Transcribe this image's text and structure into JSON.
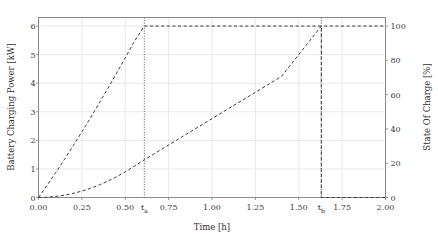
{
  "chart_data": {
    "type": "line",
    "title": "",
    "xlabel": "Time [h]",
    "ylabel": "Battery Charging Power [kW]",
    "ylabel_right": "State Of Charge [%]",
    "xlim": [
      0.0,
      2.0
    ],
    "ylim": [
      0.0,
      6.3
    ],
    "ylim_right": [
      0.0,
      105.0
    ],
    "grid": true,
    "legend": "none",
    "xticks": [
      "0.00",
      "0.25",
      "0.50",
      "0.75",
      "1.00",
      "1.25",
      "1.50",
      "1.75",
      "2.00"
    ],
    "xtick_values": [
      0.0,
      0.25,
      0.5,
      0.75,
      1.0,
      1.25,
      1.5,
      1.75,
      2.0
    ],
    "yticks_left": [
      "0",
      "1",
      "2",
      "3",
      "4",
      "5",
      "6"
    ],
    "ytick_values_left": [
      0,
      1,
      2,
      3,
      4,
      5,
      6
    ],
    "yticks_right": [
      "0",
      "20",
      "40",
      "60",
      "80",
      "100"
    ],
    "ytick_values_right": [
      0,
      20,
      40,
      60,
      80,
      100
    ],
    "annotations": [
      {
        "name": "t_a",
        "label": "t",
        "sub": "a",
        "x": 0.61
      },
      {
        "name": "t_b",
        "label": "t",
        "sub": "b",
        "x": 1.63
      }
    ],
    "series": [
      {
        "name": "Battery Charging Power",
        "axis": "left",
        "style": "dashed",
        "color": "#3c3c3c",
        "x": [
          0.0,
          0.05,
          0.1,
          0.15,
          0.2,
          0.25,
          0.3,
          0.35,
          0.4,
          0.45,
          0.5,
          0.55,
          0.61,
          0.61,
          0.8,
          1.0,
          1.2,
          1.4,
          1.63,
          1.63,
          1.8,
          2.0
        ],
        "y": [
          0.0,
          0.43,
          0.88,
          1.34,
          1.81,
          2.3,
          2.79,
          3.3,
          3.82,
          4.35,
          4.89,
          5.44,
          6.0,
          6.0,
          6.0,
          6.0,
          6.0,
          6.0,
          6.0,
          0.0,
          0.0,
          0.0
        ]
      },
      {
        "name": "State Of Charge",
        "axis": "right",
        "style": "dashed",
        "color": "#3c3c3c",
        "x": [
          0.0,
          0.05,
          0.1,
          0.15,
          0.2,
          0.25,
          0.3,
          0.35,
          0.4,
          0.45,
          0.5,
          0.55,
          0.61,
          0.8,
          1.0,
          1.2,
          1.4,
          1.63,
          1.8,
          2.0
        ],
        "y": [
          0.0,
          0.15,
          0.6,
          1.35,
          2.4,
          3.74,
          5.39,
          7.33,
          9.58,
          12.12,
          14.96,
          18.1,
          22.0,
          33.7,
          46.0,
          58.3,
          70.6,
          100.0,
          100.0,
          100.0
        ]
      }
    ]
  },
  "axes": {
    "x_label": "Time [h]",
    "y_left_label": "Battery Charging Power [kW]",
    "y_right_label": "State Of Charge [%]"
  }
}
